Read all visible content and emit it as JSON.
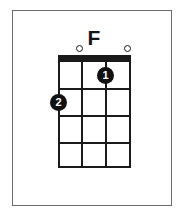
{
  "diagram": {
    "instrument": "ukulele",
    "chord_name": "F",
    "string_count": 4,
    "fret_count": 4,
    "starting_fret": 1,
    "colors": {
      "ink": "#1a1a1a",
      "frame": "#6b6b72",
      "background": "#ffffff",
      "dot_fill": "#111111",
      "dot_text": "#ffffff"
    },
    "open_strings": [
      {
        "label": "open-string-2",
        "string": 2,
        "symbol": "○"
      },
      {
        "label": "open-string-4",
        "string": 4,
        "symbol": "○"
      }
    ],
    "finger_positions": [
      {
        "finger": "1",
        "string": 3,
        "fret": 1
      },
      {
        "finger": "2",
        "string": 1,
        "fret": 2
      }
    ],
    "strings": [
      {
        "name": "string-1"
      },
      {
        "name": "string-2"
      },
      {
        "name": "string-3"
      },
      {
        "name": "string-4"
      }
    ],
    "frets": [
      {
        "name": "fret-1"
      },
      {
        "name": "fret-2"
      },
      {
        "name": "fret-3"
      },
      {
        "name": "fret-4"
      }
    ]
  }
}
